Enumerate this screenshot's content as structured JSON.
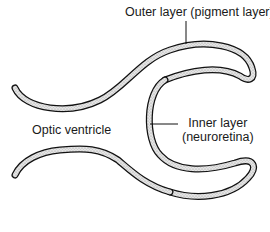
{
  "diagram": {
    "labels": {
      "outer_layer": "Outer layer (pigment layer)",
      "inner_layer_line1": "Inner layer",
      "inner_layer_line2": "(neuroretina)",
      "optic_ventricle": "Optic ventricle"
    },
    "colors": {
      "stroke": "#111111",
      "fill_stipple": "#d4d4d4",
      "text": "#1a1a1a",
      "background": "#ffffff"
    }
  }
}
